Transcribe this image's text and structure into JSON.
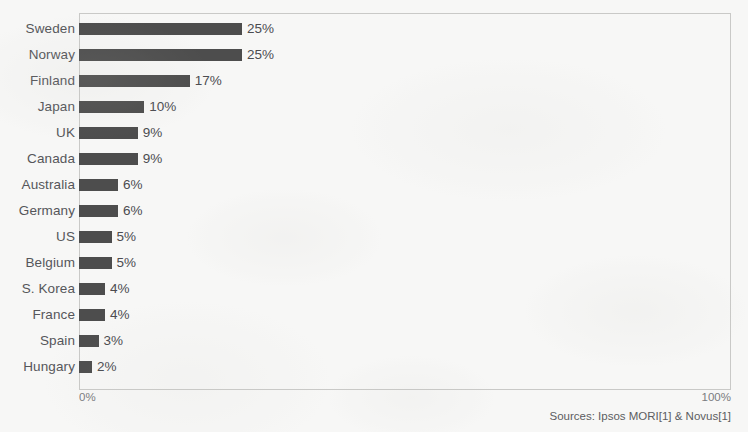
{
  "chart_data": {
    "type": "bar",
    "orientation": "horizontal",
    "title": "",
    "subtitle": "",
    "xlabel": "",
    "ylabel": "",
    "xlim": [
      0,
      100
    ],
    "grid": false,
    "legend": null,
    "bar_color": "#4d4d4d",
    "categories": [
      "Sweden",
      "Norway",
      "Finland",
      "Japan",
      "UK",
      "Canada",
      "Australia",
      "Germany",
      "US",
      "Belgium",
      "S. Korea",
      "France",
      "Spain",
      "Hungary"
    ],
    "values": [
      25,
      25,
      17,
      10,
      9,
      9,
      6,
      6,
      5,
      5,
      4,
      4,
      3,
      2
    ],
    "value_labels": [
      "25%",
      "25%",
      "17%",
      "10%",
      "9%",
      "9%",
      "6%",
      "6%",
      "5%",
      "5%",
      "4%",
      "4%",
      "3%",
      "2%"
    ],
    "axis_ticks": [
      "0%",
      "100%"
    ],
    "annotations": [
      "Sources: Ipsos MORI[1] & Novus[1]"
    ]
  },
  "axis": {
    "min_label": "0%",
    "max_label": "100%"
  },
  "footer": {
    "sources": "Sources: Ipsos MORI[1] & Novus[1]"
  }
}
